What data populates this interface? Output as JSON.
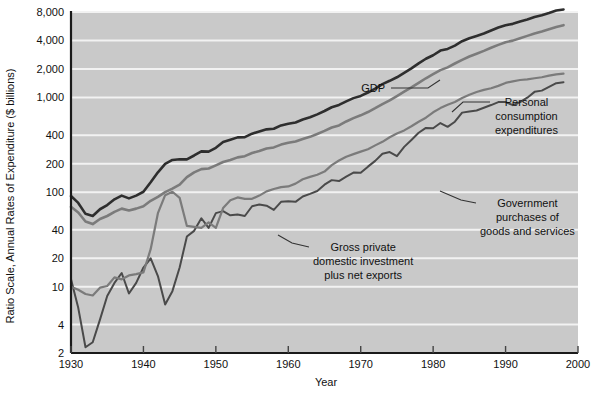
{
  "chart_data": {
    "type": "line",
    "title": "",
    "xlabel": "Year",
    "ylabel": "Ratio Scale, Annual Rates of Expenditure ($ billions)",
    "scale": "log",
    "grid": true,
    "legend_position": "inline-annotations",
    "xlim": [
      1930,
      2000
    ],
    "ylim": [
      2,
      8000
    ],
    "xticks": [
      1930,
      1940,
      1950,
      1960,
      1970,
      1980,
      1990,
      2000
    ],
    "xticklabels": [
      "1930",
      "1940",
      "1950",
      "1960",
      "1970",
      "1980",
      "1990",
      "2000"
    ],
    "yticks": [
      2,
      4,
      10,
      20,
      40,
      100,
      200,
      400,
      1000,
      2000,
      4000,
      8000
    ],
    "yticklabels": [
      "2",
      "4",
      "10",
      "20",
      "40",
      "100",
      "200",
      "400",
      "1,000",
      "2,000",
      "4,000",
      "8,000"
    ],
    "series": [
      {
        "name": "GDP",
        "color": "#2e2e2e",
        "width": 2.6,
        "x": [
          1930,
          1931,
          1932,
          1933,
          1934,
          1935,
          1936,
          1937,
          1938,
          1939,
          1940,
          1941,
          1942,
          1943,
          1944,
          1945,
          1946,
          1947,
          1948,
          1949,
          1950,
          1951,
          1952,
          1953,
          1954,
          1955,
          1956,
          1957,
          1958,
          1959,
          1960,
          1961,
          1962,
          1963,
          1964,
          1965,
          1966,
          1967,
          1968,
          1969,
          1970,
          1971,
          1972,
          1973,
          1974,
          1975,
          1976,
          1977,
          1978,
          1979,
          1980,
          1981,
          1982,
          1983,
          1984,
          1985,
          1986,
          1987,
          1988,
          1989,
          1990,
          1991,
          1992,
          1993,
          1994,
          1995,
          1996,
          1997,
          1998
        ],
        "y": [
          91,
          77,
          59,
          56,
          66,
          73,
          84,
          92,
          86,
          92,
          101,
          127,
          162,
          199,
          219,
          223,
          222,
          244,
          270,
          268,
          294,
          339,
          358,
          379,
          381,
          415,
          438,
          461,
          467,
          507,
          527,
          545,
          586,
          618,
          664,
          720,
          789,
          834,
          911,
          985,
          1039,
          1128,
          1240,
          1386,
          1501,
          1635,
          1824,
          2031,
          2295,
          2566,
          2795,
          3131,
          3259,
          3535,
          3933,
          4220,
          4463,
          4740,
          5104,
          5484,
          5803,
          5996,
          6338,
          6657,
          7072,
          7398,
          7817,
          8300,
          8511
        ]
      },
      {
        "name": "Personal consumption expenditures",
        "color": "#7b7b7b",
        "width": 2.6,
        "x": [
          1930,
          1931,
          1932,
          1933,
          1934,
          1935,
          1936,
          1937,
          1938,
          1939,
          1940,
          1941,
          1942,
          1943,
          1944,
          1945,
          1946,
          1947,
          1948,
          1949,
          1950,
          1951,
          1952,
          1953,
          1954,
          1955,
          1956,
          1957,
          1958,
          1959,
          1960,
          1961,
          1962,
          1963,
          1964,
          1965,
          1966,
          1967,
          1968,
          1969,
          1970,
          1971,
          1972,
          1973,
          1974,
          1975,
          1976,
          1977,
          1978,
          1979,
          1980,
          1981,
          1982,
          1983,
          1984,
          1985,
          1986,
          1987,
          1988,
          1989,
          1990,
          1991,
          1992,
          1993,
          1994,
          1995,
          1996,
          1997,
          1998
        ],
        "y": [
          70,
          61,
          49,
          46,
          52,
          56,
          62,
          67,
          64,
          67,
          71,
          81,
          89,
          100,
          109,
          120,
          144,
          162,
          175,
          178,
          192,
          208,
          219,
          233,
          240,
          259,
          272,
          289,
          297,
          318,
          332,
          343,
          364,
          384,
          412,
          444,
          482,
          507,
          558,
          605,
          648,
          702,
          771,
          852,
          933,
          1034,
          1152,
          1278,
          1430,
          1596,
          1762,
          1944,
          2079,
          2286,
          2498,
          2712,
          2896,
          3105,
          3356,
          3597,
          3839,
          3986,
          4235,
          4477,
          4743,
          4976,
          5256,
          5547,
          5807
        ]
      },
      {
        "name": "Gross private domestic investment plus net exports",
        "color": "#4a4a4a",
        "width": 2.0,
        "x": [
          1930,
          1931,
          1932,
          1933,
          1934,
          1935,
          1936,
          1937,
          1938,
          1939,
          1940,
          1941,
          1942,
          1943,
          1944,
          1945,
          1946,
          1947,
          1948,
          1949,
          1950,
          1951,
          1952,
          1953,
          1954,
          1955,
          1956,
          1957,
          1958,
          1959,
          1960,
          1961,
          1962,
          1963,
          1964,
          1965,
          1966,
          1967,
          1968,
          1969,
          1970,
          1971,
          1972,
          1973,
          1974,
          1975,
          1976,
          1977,
          1978,
          1979,
          1980,
          1981,
          1982,
          1983,
          1984,
          1985,
          1986,
          1987,
          1988,
          1989,
          1990,
          1991,
          1992,
          1993,
          1994,
          1995,
          1996,
          1997,
          1998
        ],
        "y": [
          12,
          6,
          2.3,
          2.6,
          4.5,
          8,
          11,
          14,
          8.5,
          11,
          16,
          20,
          13,
          6.5,
          9,
          16,
          34,
          39,
          53,
          42,
          60,
          63,
          57,
          58,
          56,
          71,
          74,
          72,
          65,
          79,
          80,
          79,
          90,
          96,
          103,
          120,
          134,
          131,
          146,
          161,
          160,
          186,
          214,
          254,
          265,
          240,
          301,
          356,
          424,
          477,
          473,
          537,
          490,
          555,
          692,
          713,
          729,
          779,
          832,
          895,
          894,
          830,
          892,
          996,
          1147,
          1182,
          1292,
          1416,
          1449
        ]
      },
      {
        "name": "Government purchases of goods and services",
        "color": "#7b7b7b",
        "width": 2.2,
        "x": [
          1930,
          1931,
          1932,
          1933,
          1934,
          1935,
          1936,
          1937,
          1938,
          1939,
          1940,
          1941,
          1942,
          1943,
          1944,
          1945,
          1946,
          1947,
          1948,
          1949,
          1950,
          1951,
          1952,
          1953,
          1954,
          1955,
          1956,
          1957,
          1958,
          1959,
          1960,
          1961,
          1962,
          1963,
          1964,
          1965,
          1966,
          1967,
          1968,
          1969,
          1970,
          1971,
          1972,
          1973,
          1974,
          1975,
          1976,
          1977,
          1978,
          1979,
          1980,
          1981,
          1982,
          1983,
          1984,
          1985,
          1986,
          1987,
          1988,
          1989,
          1990,
          1991,
          1992,
          1993,
          1994,
          1995,
          1996,
          1997,
          1998
        ],
        "y": [
          10,
          9.3,
          8.4,
          8.1,
          9.8,
          10.2,
          12.6,
          12.0,
          13.2,
          13.6,
          14.2,
          25,
          60,
          93,
          101,
          87,
          44,
          43,
          42,
          48,
          42,
          68,
          82,
          88,
          85,
          85,
          92,
          102,
          108,
          113,
          115,
          123,
          137,
          145,
          153,
          165,
          193,
          216,
          237,
          252,
          268,
          284,
          312,
          340,
          380,
          417,
          449,
          497,
          555,
          612,
          698,
          773,
          837,
          897,
          988,
          1070,
          1141,
          1203,
          1253,
          1327,
          1425,
          1481,
          1530,
          1551,
          1596,
          1635,
          1702,
          1758,
          1790
        ]
      }
    ],
    "annotations": [
      {
        "name": "gdp-annotation",
        "text_lines": [
          "GDP"
        ],
        "text_x": 385,
        "text_y": 92,
        "anchor": "end",
        "leader": [
          [
            391,
            88
          ],
          [
            428,
            88
          ],
          [
            440,
            80
          ]
        ]
      },
      {
        "name": "pce-annotation",
        "text_lines": [
          "Personal",
          "consumption",
          "expenditures"
        ],
        "text_x": 495,
        "text_y": 106,
        "anchor": "start",
        "leader": [
          [
            490,
            102
          ],
          [
            463,
            102
          ],
          [
            452,
            112
          ]
        ]
      },
      {
        "name": "government-annotation",
        "text_lines": [
          "Government",
          "purchases of",
          "goods and services"
        ],
        "text_x": 480,
        "text_y": 207,
        "anchor": "start",
        "leader": [
          [
            476,
            203
          ],
          [
            461,
            200
          ],
          [
            440,
            191
          ]
        ]
      },
      {
        "name": "investment-annotation",
        "text_lines": [
          "Gross private",
          "domestic investment",
          "plus net exports"
        ],
        "text_x": 313,
        "text_y": 251,
        "anchor": "start",
        "leader": [
          [
            309,
            247
          ],
          [
            292,
            243
          ],
          [
            278,
            235
          ]
        ]
      }
    ],
    "style": {
      "plot_background": "#c9c9c9",
      "grid_color": "#f2f2f2",
      "axis_color": "#1a1a1a",
      "page_background": "#ffffff"
    }
  }
}
